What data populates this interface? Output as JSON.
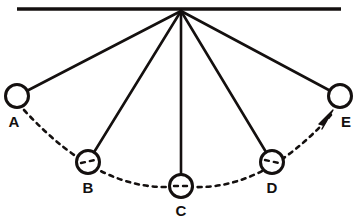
{
  "diagram": {
    "colors": {
      "stroke": "#14100f",
      "background": "#ffffff",
      "label": "#14100f"
    },
    "support_bar": {
      "name": "horizontal support bar",
      "x1": 17,
      "y1": 9,
      "x2": 341,
      "y2": 9,
      "thickness": 3.4
    },
    "pivot": {
      "name": "pivot point",
      "x": 181,
      "y": 11
    },
    "bob_radius": 11.5,
    "string_thickness": 2.6,
    "bobs": [
      {
        "id": "A",
        "label": "A",
        "cx": 17,
        "cy": 96,
        "label_x": 14,
        "label_y": 123,
        "has_center_dashes": false
      },
      {
        "id": "B",
        "label": "B",
        "cx": 88,
        "cy": 162,
        "label_x": 88,
        "label_y": 189,
        "has_center_dashes": true
      },
      {
        "id": "C",
        "label": "C",
        "cx": 181,
        "cy": 186,
        "label_x": 181,
        "label_y": 212,
        "has_center_dashes": true
      },
      {
        "id": "D",
        "label": "D",
        "cx": 272,
        "cy": 162,
        "label_x": 272,
        "label_y": 189,
        "has_center_dashes": true
      },
      {
        "id": "E",
        "label": "E",
        "cx": 340,
        "cy": 96,
        "label_x": 346,
        "label_y": 123,
        "has_center_dashes": false
      }
    ],
    "strings": [
      {
        "name": "string-to-A",
        "x1": 181,
        "y1": 11,
        "x2": 17,
        "y2": 96
      },
      {
        "name": "string-to-B",
        "x1": 181,
        "y1": 11,
        "x2": 88,
        "y2": 162
      },
      {
        "name": "string-to-C",
        "x1": 181,
        "y1": 11,
        "x2": 181,
        "y2": 186
      },
      {
        "name": "string-to-D",
        "x1": 181,
        "y1": 11,
        "x2": 272,
        "y2": 162
      },
      {
        "name": "string-to-E",
        "x1": 181,
        "y1": 11,
        "x2": 340,
        "y2": 96
      }
    ],
    "swing_arc": {
      "name": "dashed swing path arc",
      "path": "M 24 110 Q 103 196 181 186 Q 259 196 331 115",
      "dash_pattern": "4,5",
      "thickness": 2.6,
      "direction": "left to right toward E"
    },
    "arrowhead": {
      "name": "direction arrowhead",
      "points": "333,110 319,124 324,125 322,129",
      "tip_x": 333,
      "tip_y": 110
    },
    "center_dash_marks": [
      {
        "bob": "B",
        "x1": 81,
        "y1": 163,
        "x2": 95,
        "y2": 160
      },
      {
        "bob": "C",
        "x1": 174,
        "y1": 186,
        "x2": 188,
        "y2": 186
      },
      {
        "bob": "D",
        "x1": 265,
        "y1": 160,
        "x2": 279,
        "y2": 163
      }
    ]
  }
}
